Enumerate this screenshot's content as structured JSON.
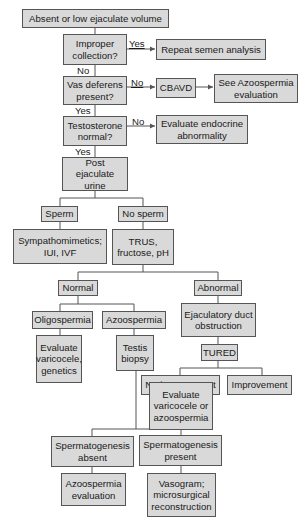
{
  "diagram": {
    "type": "flowchart",
    "nodes": {
      "start": "Absent or low ejaculate volume",
      "improper": "Improper\ncollection?",
      "repeat": "Repeat semen analysis",
      "vas": "Vas deferens\npresent?",
      "cbavd": "CBAVD",
      "see_azoo": "See Azoospermia\nevaluation",
      "testosterone": "Testosterone\nnormal?",
      "endocrine": "Evaluate endocrine\nabnormality",
      "post": "Post ejaculate\nurine",
      "sperm": "Sperm",
      "nosperm": "No sperm",
      "sympatho": "Sympathomimetics;\nIUI, IVF",
      "trus": "TRUS,\nfructose, pH",
      "normal": "Normal",
      "abnormal": "Abnormal",
      "oligo": "Oligospermia",
      "azoo": "Azoospermia",
      "ejac": "Ejaculatory duct\nobstruction",
      "eval_vari": "Evaluate\nvaricocele,\ngenetics",
      "testis": "Testis\nbiopsy",
      "tured": "TURED",
      "noimp": "No improvement",
      "imp": "Improvement",
      "eval_vari_azoo": "Evaluate\nvaricocele or\nazoospermia",
      "sg_absent": "Spermatogenesis\nabsent",
      "sg_present": "Spermatogenesis\npresent",
      "azoo_eval": "Azoospermia\nevaluation",
      "vasogram": "Vasogram;\nmicrosurgical\nreconstruction"
    },
    "edge_labels": {
      "improper_yes": "Yes",
      "improper_no": "No",
      "vas_no": "No",
      "vas_yes": "Yes",
      "testosterone_no": "No",
      "testosterone_yes": "Yes"
    },
    "colors": {
      "box_fill": "#d9d9d9",
      "box_border": "#555555",
      "line": "#555555"
    }
  }
}
